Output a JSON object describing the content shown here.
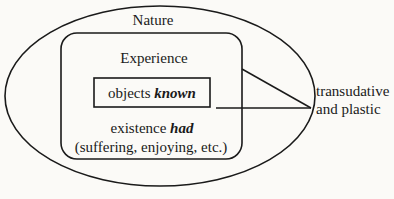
{
  "diagram": {
    "outer_label": "Nature",
    "middle_label": "Experience",
    "inner_label_plain": "objects",
    "inner_label_emph": "known",
    "lower_label_plain": "existence",
    "lower_label_emph": "had",
    "lower_sublabel": "(suffering, enjoying, etc.)",
    "annotation_line1": "transudative",
    "annotation_line2": "and plastic"
  }
}
